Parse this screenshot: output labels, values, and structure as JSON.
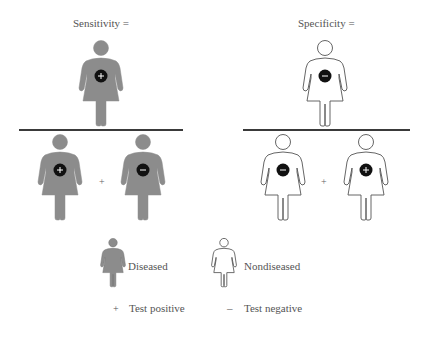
{
  "colors": {
    "diseased_fill": "#8c8c8c",
    "nondiseased_fill": "#ffffff",
    "outline": "#555555",
    "badge": "#111111",
    "rule": "#3a3a3a"
  },
  "panels": [
    {
      "title": "Sensitivity =",
      "numerator": {
        "figure": "diseased",
        "test": "+"
      },
      "denominator": [
        {
          "figure": "diseased",
          "test": "+"
        },
        {
          "figure": "diseased",
          "test": "−"
        }
      ],
      "operator": "+"
    },
    {
      "title": "Specificity =",
      "numerator": {
        "figure": "nondiseased",
        "test": "−"
      },
      "denominator": [
        {
          "figure": "nondiseased",
          "test": "−"
        },
        {
          "figure": "nondiseased",
          "test": "+"
        }
      ],
      "operator": "+"
    }
  ],
  "legend": {
    "diseased": "Diseased",
    "nondiseased": "Nondiseased",
    "positive_symbol": "+",
    "positive_label": "Test positive",
    "negative_symbol": "–",
    "negative_label": "Test negative"
  }
}
